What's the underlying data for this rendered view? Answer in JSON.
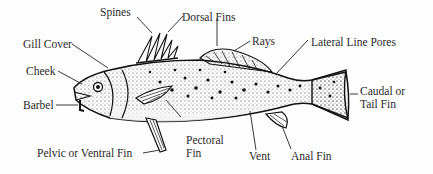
{
  "diagram": {
    "labels": {
      "spines": "Spines",
      "dorsal_fins": "Dorsal Fins",
      "rays": "Rays",
      "lateral_line_pores": "Lateral Line Pores",
      "gill_cover": "Gill Cover",
      "cheek": "Cheek",
      "barbel": "Barbel",
      "caudal_line1": "Caudal or",
      "caudal_line2": "Tail Fin",
      "pectoral_line1": "Pectoral",
      "pectoral_line2": "Fin",
      "pelvic": "Pelvic or Ventral Fin",
      "vent": "Vent",
      "anal_fin": "Anal Fin"
    }
  }
}
